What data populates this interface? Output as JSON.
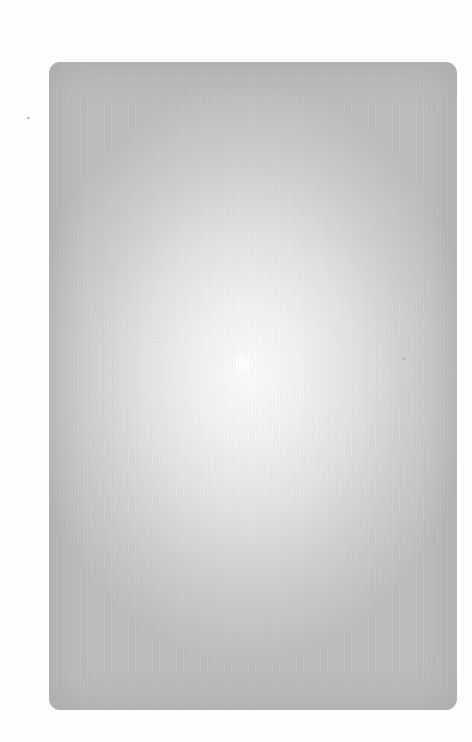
{
  "page": {
    "type": "blank-card",
    "text": ""
  },
  "colors": {
    "background": "#ffffff",
    "card_center": "#fbfbfb",
    "card_edge": "#bdbdbd"
  }
}
